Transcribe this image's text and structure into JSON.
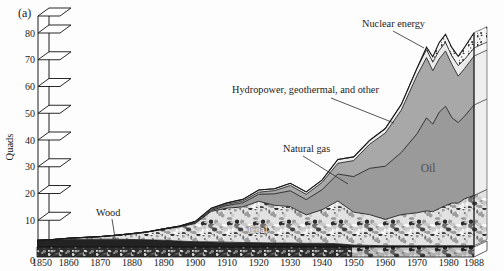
{
  "figure": {
    "panel_label": "(a)"
  },
  "y_axis": {
    "label": "Quads",
    "ticks": [
      0,
      10,
      20,
      30,
      40,
      50,
      60,
      70,
      80
    ]
  },
  "x_axis": {
    "ticks": [
      1850,
      1860,
      1870,
      1880,
      1890,
      1900,
      1910,
      1920,
      1930,
      1940,
      1950,
      1960,
      1970,
      1980,
      1988
    ]
  },
  "colors": {
    "wood": "#232323",
    "oil": "#9a9a9a",
    "gas": "#a8a8a8",
    "hydro": "#ebebeb",
    "coal_base": "#e2e2e2",
    "nuclear_base": "#f5f5f5",
    "boundary_line": "#1b1b1b",
    "floor_base": "#2d2d2d"
  },
  "chart_data": {
    "type": "area",
    "stacked": true,
    "title": "",
    "xlabel": "",
    "ylabel": "Quads",
    "ylim": [
      0,
      80
    ],
    "xlim": [
      1850,
      1988
    ],
    "grid": false,
    "x": [
      1850,
      1855,
      1860,
      1865,
      1870,
      1875,
      1880,
      1885,
      1890,
      1895,
      1900,
      1905,
      1910,
      1915,
      1920,
      1925,
      1930,
      1935,
      1940,
      1945,
      1950,
      1955,
      1960,
      1965,
      1970,
      1973,
      1975,
      1977,
      1979,
      1981,
      1983,
      1985,
      1988
    ],
    "series": [
      {
        "name": "Wood",
        "texture": "solid-dark",
        "values": [
          2.4,
          2.6,
          2.8,
          2.9,
          2.9,
          2.9,
          2.8,
          2.7,
          2.5,
          2.2,
          2.0,
          1.9,
          1.8,
          1.7,
          1.6,
          1.5,
          1.5,
          1.4,
          1.4,
          1.2,
          0.7,
          0.6,
          0.5,
          0.5,
          0.5,
          0.5,
          0.5,
          0.5,
          0.5,
          0.5,
          0.5,
          0.5,
          0.5
        ]
      },
      {
        "name": "Coal",
        "texture": "pebble",
        "values": [
          0.1,
          0.2,
          0.5,
          0.7,
          1.0,
          1.5,
          2.1,
          2.9,
          4.1,
          5.3,
          6.8,
          11.4,
          12.7,
          13.3,
          15.5,
          14.1,
          13.6,
          10.6,
          12.5,
          16.0,
          12.3,
          11.5,
          9.8,
          11.6,
          12.3,
          13.0,
          12.7,
          13.9,
          15.0,
          15.9,
          15.9,
          17.5,
          18.8
        ]
      },
      {
        "name": "Oil",
        "texture": "gray",
        "values": [
          0,
          0,
          0,
          0,
          0,
          0,
          0.1,
          0.1,
          0.2,
          0.2,
          0.2,
          0.4,
          1.0,
          1.5,
          2.6,
          4.3,
          5.9,
          5.7,
          7.5,
          10.1,
          13.3,
          17.3,
          19.9,
          23.2,
          29.5,
          34.8,
          32.7,
          36.0,
          37.1,
          32.0,
          30.1,
          30.9,
          33.8
        ]
      },
      {
        "name": "Natural gas",
        "texture": "gray-light",
        "values": [
          0,
          0,
          0,
          0,
          0,
          0,
          0,
          0,
          0,
          0.1,
          0.3,
          0.4,
          0.5,
          0.7,
          0.8,
          1.2,
          2.0,
          2.0,
          2.7,
          4.0,
          6.0,
          9.0,
          12.4,
          15.8,
          21.8,
          22.5,
          20.0,
          19.9,
          20.7,
          19.9,
          17.4,
          17.8,
          18.3
        ]
      },
      {
        "name": "Hydropower, geothermal, and other",
        "texture": "pale",
        "values": [
          0,
          0,
          0,
          0,
          0,
          0,
          0,
          0,
          0,
          0,
          0.3,
          0.4,
          0.5,
          0.6,
          0.8,
          0.7,
          0.8,
          0.9,
          0.9,
          1.4,
          1.4,
          1.4,
          1.7,
          2.1,
          2.7,
          3.0,
          3.2,
          3.2,
          3.2,
          3.1,
          3.9,
          3.4,
          3.0
        ]
      },
      {
        "name": "Nuclear energy",
        "texture": "stipple",
        "values": [
          0,
          0,
          0,
          0,
          0,
          0,
          0,
          0,
          0,
          0,
          0,
          0,
          0,
          0,
          0,
          0,
          0,
          0,
          0,
          0,
          0,
          0,
          0,
          0.04,
          0.08,
          0.9,
          2.0,
          2.9,
          3.0,
          3.2,
          3.5,
          4.5,
          5.7
        ]
      }
    ],
    "annotations": [
      {
        "series": "Wood",
        "label": "Wood"
      },
      {
        "series": "Coal",
        "label": "Coal"
      },
      {
        "series": "Oil",
        "label": "Oil"
      },
      {
        "series": "Natural gas",
        "label": "Natural gas"
      },
      {
        "series": "Hydropower, geothermal, and other",
        "label": "Hydropower, geothermal, and other"
      },
      {
        "series": "Nuclear energy",
        "label": "Nuclear energy"
      }
    ],
    "legend_position": "inline-annotations"
  }
}
